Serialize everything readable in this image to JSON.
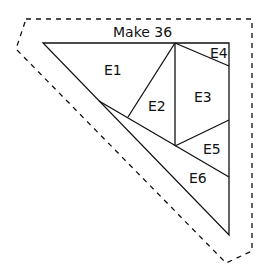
{
  "diagram": {
    "title": "Make 36",
    "pieces": [
      {
        "id": "E1",
        "label": "E1"
      },
      {
        "id": "E2",
        "label": "E2"
      },
      {
        "id": "E3",
        "label": "E3"
      },
      {
        "id": "E4",
        "label": "E4"
      },
      {
        "id": "E5",
        "label": "E5"
      },
      {
        "id": "E6",
        "label": "E6"
      }
    ],
    "colors": {
      "line": "#111111",
      "background": "#ffffff"
    }
  }
}
